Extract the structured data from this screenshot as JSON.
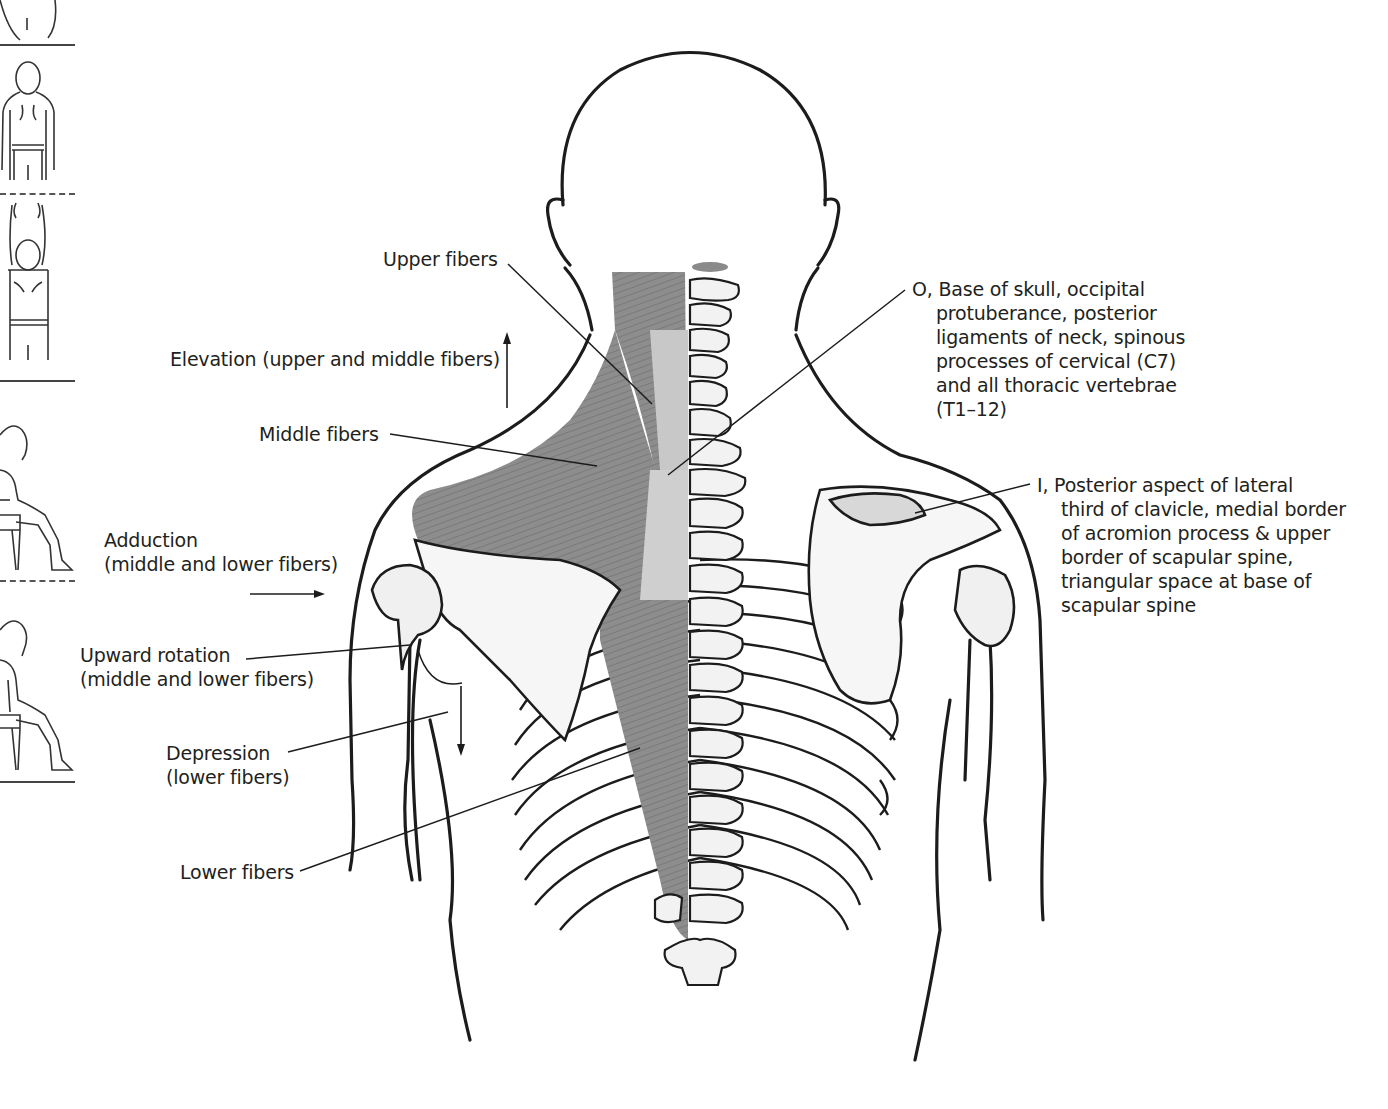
{
  "figure": {
    "colors": {
      "muscle": "#8a8a8a",
      "muscle_light": "#c4c4c4",
      "bone": "#f4f4f4",
      "outline": "#1c1c1c",
      "text": "#231f20"
    }
  },
  "labels": {
    "upper_fibers": "Upper fibers",
    "elevation": "Elevation (upper and middle fibers)",
    "middle_fibers": "Middle fibers",
    "adduction_line1": "Adduction",
    "adduction_line2": "(middle and lower fibers)",
    "upward_rotation_line1": "Upward rotation",
    "upward_rotation_line2": "(middle and lower fibers)",
    "depression_line1": "Depression",
    "depression_line2": "(lower fibers)",
    "lower_fibers": "Lower fibers",
    "origin": {
      "line1": "O, Base of skull, occipital",
      "line2": "protuberance, posterior",
      "line3": "ligaments of neck, spinous",
      "line4": "processes of cervical (C7)",
      "line5": "and all thoracic vertebrae",
      "line6": "(T1–12)"
    },
    "insertion": {
      "line1": "I, Posterior aspect of lateral",
      "line2": "third of clavicle, medial border",
      "line3": "of acromion process & upper",
      "line4": "border of scapular spine,",
      "line5": "triangular space at base of",
      "line6": "scapular spine"
    }
  },
  "side_panel": {
    "figures": [
      "standing-back-arms-down",
      "standing-back-arms-raised",
      "seated-side-view",
      "seated-side-view-holding-chair"
    ]
  }
}
